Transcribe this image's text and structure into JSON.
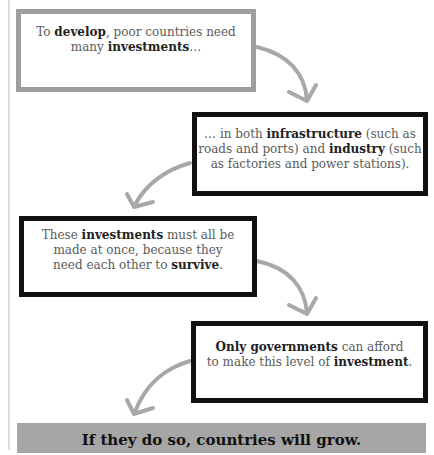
{
  "diagram": {
    "steps": [
      {
        "parts": [
          "To ",
          "develop",
          ", poor countries need",
          "many ",
          "investments",
          "…"
        ],
        "border": "gray"
      },
      {
        "parts": [
          "… in both ",
          "infrastructure",
          " (such as",
          "roads and ports) and ",
          "industry",
          " (such",
          "as factories and power stations)."
        ],
        "border": "black"
      },
      {
        "parts": [
          "These ",
          "investments",
          " must all be",
          "made at once, because they",
          "need each other to ",
          "survive",
          "."
        ],
        "border": "black"
      },
      {
        "parts": [
          "Only governments",
          " can afford",
          "to make this level of ",
          "investment",
          "."
        ],
        "border": "black"
      }
    ],
    "conclusion": "If they do so, countries will grow.",
    "colors": {
      "arrow": "#a8a8a8",
      "banner": "#a6a6a6",
      "gray_border": "#9e9e9e",
      "black_border": "#111111"
    },
    "arrows": [
      "arrow-1-to-2",
      "arrow-2-to-3",
      "arrow-3-to-4",
      "arrow-4-to-conclusion"
    ]
  }
}
